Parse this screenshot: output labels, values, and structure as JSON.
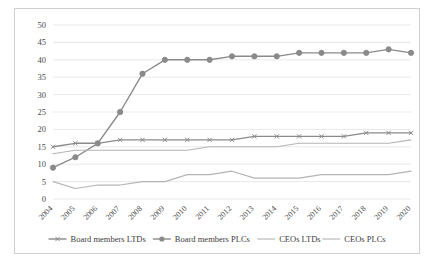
{
  "chart_data": {
    "type": "line",
    "title": "",
    "subtitle": "",
    "xlabel": "",
    "ylabel": "",
    "grid": true,
    "legend_position": "bottom",
    "ylim": [
      0,
      50
    ],
    "yticks": [
      0,
      5,
      10,
      15,
      20,
      25,
      30,
      35,
      40,
      45,
      50
    ],
    "categories": [
      "2004",
      "2005",
      "2006",
      "2007",
      "2008",
      "2009",
      "2010",
      "2011",
      "2012",
      "2013",
      "2014",
      "2015",
      "2016",
      "2017",
      "2018",
      "2019",
      "2020"
    ],
    "series": [
      {
        "name": "Board members LTDs",
        "color": "#8a8a8a",
        "marker": "x",
        "values": [
          15,
          16,
          16,
          17,
          17,
          17,
          17,
          17,
          17,
          18,
          18,
          18,
          18,
          18,
          19,
          19,
          19
        ]
      },
      {
        "name": "Board members PLCs",
        "color": "#8a8a8a",
        "marker": "circle",
        "values": [
          9,
          12,
          16,
          25,
          36,
          40,
          40,
          40,
          41,
          41,
          41,
          42,
          42,
          42,
          42,
          43,
          42
        ]
      },
      {
        "name": "CEOs LTDs",
        "color": "#b4b4b4",
        "marker": "none",
        "values": [
          13,
          14,
          14,
          14,
          14,
          14,
          14,
          15,
          15,
          15,
          15,
          16,
          16,
          16,
          16,
          16,
          17
        ]
      },
      {
        "name": "CEOs PLCs",
        "color": "#b4b4b4",
        "marker": "none",
        "values": [
          5,
          3,
          4,
          4,
          5,
          5,
          7,
          7,
          8,
          6,
          6,
          6,
          7,
          7,
          7,
          7,
          8
        ]
      }
    ]
  },
  "axis": {
    "ytick_labels": [
      "0",
      "5",
      "10",
      "15",
      "20",
      "25",
      "30",
      "35",
      "40",
      "45",
      "50"
    ],
    "xtick_labels": [
      "2004",
      "2005",
      "2006",
      "2007",
      "2008",
      "2009",
      "2010",
      "2011",
      "2012",
      "2013",
      "2014",
      "2015",
      "2016",
      "2017",
      "2018",
      "2019",
      "2020"
    ]
  },
  "legend": {
    "items": [
      {
        "label": "Board members LTDs",
        "color": "#8a8a8a",
        "marker": "x"
      },
      {
        "label": "Board members PLCs",
        "color": "#8a8a8a",
        "marker": "circle"
      },
      {
        "label": "CEOs LTDs",
        "color": "#b4b4b4",
        "marker": "none"
      },
      {
        "label": "CEOs PLCs",
        "color": "#b4b4b4",
        "marker": "none"
      }
    ]
  },
  "colors": {
    "grid": "#e9e9e9",
    "frame": "#d0d0d0",
    "text": "#4a4a4a",
    "series_dark": "#8a8a8a",
    "series_light": "#b4b4b4"
  }
}
